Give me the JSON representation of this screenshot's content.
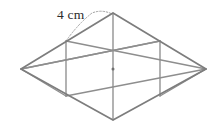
{
  "figure": {
    "background_color": "#ffffff",
    "outline_color": "#7d7d7d",
    "inner_line_color": "#8e8e8e",
    "leader_color": "#a6a6a6",
    "text_color": "#2b2b2b",
    "shape_type": "rhombus",
    "triangle_count": 6
  },
  "labels": {
    "side_length": "4 cm"
  },
  "geometry": {
    "vertices": {
      "top": [
        113,
        13
      ],
      "left": [
        21,
        69
      ],
      "right": [
        206,
        69
      ],
      "bottom": [
        113,
        120
      ],
      "upper_left_mid": [
        66,
        41
      ],
      "upper_right_mid": [
        160,
        41
      ],
      "lower_left_mid": [
        66,
        96
      ],
      "lower_right_mid": [
        160,
        96
      ],
      "center": [
        113,
        69
      ]
    },
    "outline_path": "M 113 13 L 206 69 L 113 120 L 21 69 Z",
    "inner_segments": [
      {
        "name": "center-vertical",
        "from": [
          113,
          13
        ],
        "to": [
          113,
          120
        ]
      },
      {
        "name": "left-vertical",
        "from": [
          66,
          41
        ],
        "to": [
          66,
          96
        ]
      },
      {
        "name": "right-vertical",
        "from": [
          160,
          41
        ],
        "to": [
          160,
          96
        ]
      },
      {
        "name": "diagonal-upper-left-to-lower-right",
        "from": [
          66,
          41
        ],
        "to": [
          206,
          69
        ]
      },
      {
        "name": "diagonal-upper-right-to-lower-left",
        "from": [
          160,
          41
        ],
        "to": [
          21,
          69
        ]
      },
      {
        "name": "diagonal-left-to-upper-right",
        "from": [
          21,
          69
        ],
        "to": [
          160,
          41
        ]
      },
      {
        "name": "diagonal-lower-left-to-right",
        "from": [
          66,
          96
        ],
        "to": [
          206,
          69
        ]
      }
    ],
    "leader_path": "M 66 41 Q 78 24 92 13 Q 102 9 112 14"
  }
}
